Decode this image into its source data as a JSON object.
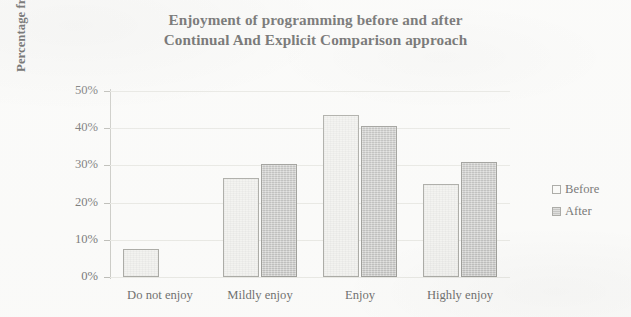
{
  "chart_data": {
    "type": "bar",
    "title": "Enjoyment of programming before and after Continual And Explicit Comparison approach",
    "title_lines": [
      "Enjoyment of programming before and after",
      "Continual And Explicit Comparison approach"
    ],
    "xlabel": "",
    "ylabel": "Percentage frequency",
    "categories": [
      "Do not enjoy",
      "Mildly enjoy",
      "Enjoy",
      "Highly enjoy"
    ],
    "series": [
      {
        "name": "Before",
        "values": [
          7.5,
          26.5,
          43.5,
          25.0
        ]
      },
      {
        "name": "After",
        "values": [
          0,
          30.5,
          40.5,
          31.0
        ]
      }
    ],
    "ylim": [
      0,
      50
    ],
    "yticks": [
      0,
      10,
      20,
      30,
      40,
      50
    ],
    "ytick_labels": [
      "0%",
      "10%",
      "20%",
      "30%",
      "40%",
      "50%"
    ],
    "grid": true,
    "legend_position": "right",
    "colors": {
      "before_fill": "#f1f1ee",
      "before_border": "#8f8f89",
      "after_fill": "#bcbcba",
      "after_border": "#7e7e79",
      "gridline": "#e2e2dd",
      "axis": "#bcbcb6",
      "text": "#3a3a3a",
      "background": "#fbfbfa"
    }
  }
}
